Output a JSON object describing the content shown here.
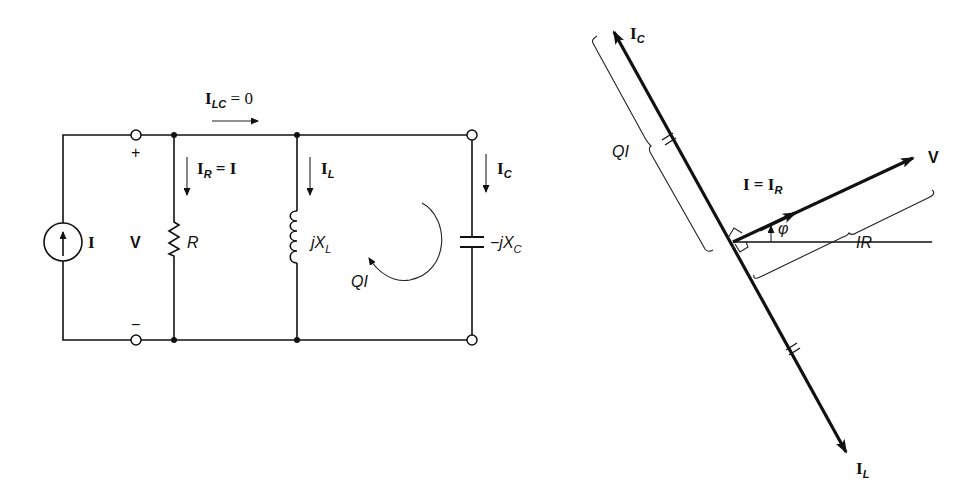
{
  "circuit": {
    "source": {
      "label": "I",
      "type": "current-source"
    },
    "voltage": {
      "label": "V",
      "plus": "+",
      "minus": "−"
    },
    "top_current": {
      "main": "I",
      "sub": "LC",
      "rest": " = 0"
    },
    "resistor": {
      "label": "R",
      "current_main": "I",
      "current_sub": "R",
      "current_rest": " = I"
    },
    "inductor": {
      "label_pre": "jX",
      "label_sub": "L",
      "current_main": "I",
      "current_sub": "L"
    },
    "capacitor": {
      "label_pre": "−jX",
      "label_sub": "C",
      "current_main": "I",
      "current_sub": "C"
    },
    "circulating": {
      "label": "QI"
    }
  },
  "phasor": {
    "ic": {
      "main": "I",
      "sub": "C"
    },
    "il": {
      "main": "I",
      "sub": "L"
    },
    "v": {
      "label": "V"
    },
    "ir_eq": {
      "main": "I = I",
      "sub": "R"
    },
    "phi": {
      "label": "φ"
    },
    "qi_brace": {
      "label": "QI"
    },
    "ir_brace": {
      "label": "IR"
    }
  }
}
